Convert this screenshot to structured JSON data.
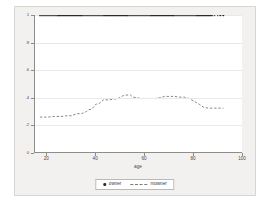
{
  "chart_data": {
    "type": "scatter",
    "title": "",
    "xlabel": "age",
    "ylabel": "",
    "xlim": [
      15,
      100
    ],
    "ylim": [
      0,
      1
    ],
    "grid": true,
    "legend_position": "bottom-center",
    "xticks": [
      20,
      40,
      60,
      80,
      100
    ],
    "xticklabels": [
      "20",
      "40",
      "60",
      "80",
      "100"
    ],
    "yticks": [
      0,
      0.2,
      0.4,
      0.6,
      0.8,
      1
    ],
    "yticklabels": [
      "0",
      ".2",
      ".4",
      ".6",
      ".8",
      "1"
    ],
    "series": [
      {
        "name": "owner",
        "type": "scatter",
        "marker": "filled-circle",
        "color": "#2b2b2b",
        "description": "Binary outcome plotted at 0 or 1 for each observation across ages 17-95",
        "points_y1_x": [
          17,
          17.4,
          17.8,
          18.2,
          18.6,
          19,
          19.4,
          19.8,
          20.2,
          20.6,
          21,
          21.4,
          21.8,
          22.2,
          22.6,
          23,
          23.4,
          23.8,
          24.2,
          24.6,
          25,
          25.4,
          25.8,
          26.2,
          26.6,
          27,
          27.4,
          27.8,
          28.2,
          28.6,
          29,
          29.4,
          29.8,
          30.2,
          30.6,
          31,
          31.4,
          31.8,
          32.2,
          32.6,
          33,
          33.4,
          33.8,
          34.2,
          34.6,
          35,
          35.4,
          35.8,
          36.2,
          36.6,
          37,
          37.4,
          37.8,
          38.2,
          38.6,
          39,
          39.4,
          39.8,
          40.2,
          40.6,
          41,
          41.4,
          41.8,
          42.2,
          42.6,
          43,
          43.4,
          43.8,
          44.2,
          44.6,
          45,
          45.4,
          45.8,
          46.2,
          46.6,
          47,
          47.4,
          47.8,
          48.2,
          48.6,
          49,
          49.4,
          49.8,
          50.2,
          50.6,
          51,
          51.4,
          51.8,
          52.2,
          52.6,
          53,
          53.4,
          53.8,
          54.2,
          54.6,
          55,
          55.4,
          55.8,
          56.2,
          56.6,
          57,
          57.4,
          57.8,
          58.2,
          58.6,
          59,
          59.4,
          59.8,
          60.2,
          60.6,
          61,
          61.4,
          61.8,
          62.2,
          62.6,
          63,
          63.4,
          63.8,
          64.2,
          64.6,
          65,
          65.4,
          65.8,
          66.2,
          66.6,
          67,
          67.4,
          67.8,
          68.2,
          68.6,
          69,
          69.4,
          69.8,
          70.2,
          70.6,
          71,
          71.4,
          71.8,
          72.2,
          72.6,
          73,
          73.4,
          73.8,
          74.2,
          74.6,
          75,
          75.4,
          75.8,
          76.2,
          76.6,
          77,
          77.4,
          77.8,
          78.2,
          78.6,
          79,
          79.4,
          79.8,
          80.2,
          80.6,
          81,
          81.4,
          81.8,
          82.2,
          82.6,
          83,
          83.4,
          83.8,
          84.2,
          84.6,
          85,
          85.4,
          85.8,
          86.2,
          86.6,
          87,
          87.6,
          88.4,
          89.6,
          90.8,
          92
        ],
        "points_y0_x": [
          17,
          17.4,
          17.8,
          18.2,
          18.6,
          19,
          19.4,
          19.8,
          20.2,
          20.6,
          21,
          21.4,
          21.8,
          22.2,
          22.6,
          23,
          23.4,
          23.8,
          24.2,
          24.6,
          25,
          25.4,
          25.8,
          26.2,
          26.6,
          27,
          27.4,
          27.8,
          28.2,
          28.6,
          29,
          29.4,
          29.8,
          30.2,
          30.6,
          31,
          31.4,
          31.8,
          32.2,
          32.6,
          33,
          33.4,
          33.8,
          34.2,
          34.6,
          35,
          35.4,
          35.8,
          36.2,
          36.6,
          37,
          37.4,
          37.8,
          38.2,
          38.6,
          39,
          39.4,
          39.8,
          40.2,
          40.6,
          41,
          41.4,
          41.8,
          42.2,
          42.6,
          43,
          43.4,
          43.8,
          44.2,
          44.6,
          45,
          45.4,
          45.8,
          46.2,
          46.6,
          47,
          47.4,
          47.8,
          48.2,
          48.6,
          49,
          49.4,
          49.8,
          50.2,
          50.6,
          51,
          51.4,
          51.8,
          52.2,
          52.6,
          53,
          53.4,
          53.8,
          54.2,
          54.6,
          55,
          55.4,
          55.8,
          56.2,
          56.6,
          57,
          57.4,
          57.8,
          58.2,
          58.6,
          59,
          59.4,
          59.8,
          60.2,
          60.6,
          61,
          61.4,
          61.8,
          62.2,
          62.6,
          63,
          63.4,
          63.8,
          64.2,
          64.6,
          65,
          65.4,
          65.8,
          66.2,
          66.6,
          67,
          67.4,
          67.8,
          68.2,
          68.6,
          69,
          69.4,
          69.8,
          70.2,
          70.6,
          71,
          71.4,
          71.8,
          72.2,
          72.6,
          73,
          73.4,
          73.8,
          74.2,
          74.6,
          75,
          75.4,
          75.8,
          76.2,
          76.6,
          77,
          77.4,
          77.8,
          78.2,
          78.6,
          79,
          79.4,
          79.8,
          80.2,
          80.6,
          81,
          81.4,
          81.8,
          82.2,
          82.6,
          83,
          83.4,
          83.8,
          84.2,
          85,
          85.8,
          86.6,
          87.4,
          88.2,
          89,
          90,
          94
        ]
      },
      {
        "name": "mowner",
        "type": "line",
        "linestyle": "dashed",
        "color": "#7a7a78",
        "description": "Step-shaped mean of owner by age",
        "x": [
          17,
          20,
          23,
          26,
          28,
          30,
          32,
          34,
          36,
          37,
          38,
          40,
          41,
          43,
          45,
          47,
          49,
          51,
          52,
          54,
          55,
          57,
          58,
          60,
          62,
          64,
          66,
          68,
          70,
          72,
          74,
          76,
          78,
          80,
          82,
          84,
          86,
          88,
          90,
          92
        ],
        "y": [
          0.26,
          0.26,
          0.265,
          0.265,
          0.27,
          0.27,
          0.285,
          0.285,
          0.3,
          0.315,
          0.315,
          0.355,
          0.355,
          0.385,
          0.385,
          0.39,
          0.395,
          0.415,
          0.42,
          0.42,
          0.405,
          0.4,
          0.395,
          0.395,
          0.395,
          0.395,
          0.4,
          0.41,
          0.41,
          0.41,
          0.405,
          0.405,
          0.395,
          0.375,
          0.355,
          0.33,
          0.325,
          0.325,
          0.325,
          0.325
        ]
      }
    ]
  },
  "legend": {
    "items": [
      {
        "label": "owner",
        "marker": "dot"
      },
      {
        "label": "mowner",
        "marker": "dash"
      }
    ]
  },
  "axes": {
    "x_title": "age"
  },
  "colors": {
    "figure_background": "#f2f1ef",
    "plot_background": "#ffffff",
    "axis": "#8e8d8a",
    "grid": "#e7e9ec",
    "marker": "#2b2b2b",
    "line": "#7a7a78"
  }
}
